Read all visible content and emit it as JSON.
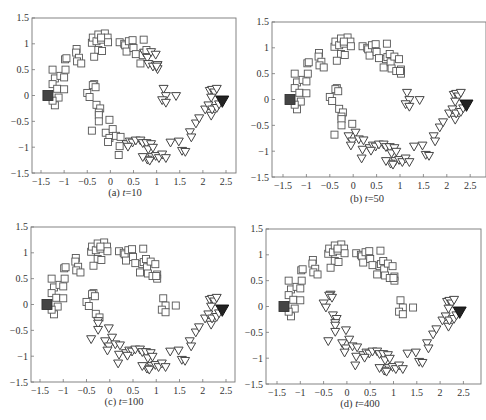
{
  "figure": {
    "panels": [
      {
        "id": "a",
        "caption_prefix": "(a) ",
        "caption_var": "t",
        "caption_value": "=10"
      },
      {
        "id": "b",
        "caption_prefix": "(b) ",
        "caption_var": "t",
        "caption_value": "=50"
      },
      {
        "id": "c",
        "caption_prefix": "(c) ",
        "caption_var": "t",
        "caption_value": "=100"
      },
      {
        "id": "d",
        "caption_prefix": "(d) ",
        "caption_var": "t",
        "caption_value": "=400"
      }
    ],
    "x_ticks": [
      "-1.5",
      "-1",
      "-0.5",
      "0",
      "0.5",
      "1",
      "1.5",
      "2",
      "2.5"
    ],
    "y_ticks": [
      "1.5",
      "1",
      "0.5",
      "0",
      "-0.5",
      "-1",
      "-1.5"
    ],
    "colors": {
      "square_edge": "#555555",
      "triangle_edge": "#444444",
      "labeled_square": "#444444",
      "labeled_triangle": "#222222",
      "frame": "#777777"
    }
  },
  "chart_data": [
    {
      "type": "scatter",
      "title": "(a) t=10",
      "xlabel": "",
      "ylabel": "",
      "xlim": [
        -1.7,
        2.7
      ],
      "ylim": [
        -1.5,
        1.5
      ],
      "x_ticks": [
        -1.5,
        -1,
        -0.5,
        0,
        0.5,
        1,
        1.5,
        2,
        2.5
      ],
      "y_ticks": [
        -1.5,
        -1,
        -0.5,
        0,
        0.5,
        1,
        1.5
      ],
      "grid": false,
      "legend": "none",
      "series": [
        {
          "name": "class 1 (squares)",
          "marker": "square-open",
          "note": "upper moon plus inner part of lower moon"
        },
        {
          "name": "class 2 (triangles)",
          "marker": "triangle-down-open",
          "note": "outer parts of both moons near class-2 seed"
        },
        {
          "name": "labeled class 1",
          "marker": "square-filled",
          "x": [
            -1.35
          ],
          "y": [
            0.0
          ]
        },
        {
          "name": "labeled class 2",
          "marker": "triangle-down-filled",
          "x": [
            2.42
          ],
          "y": [
            -0.12
          ]
        }
      ]
    },
    {
      "type": "scatter",
      "title": "(b) t=50",
      "xlim": [
        -1.7,
        2.7
      ],
      "ylim": [
        -1.5,
        1.5
      ],
      "grid": false,
      "legend": "none",
      "series": [
        {
          "name": "class 1 (squares)",
          "marker": "square-open",
          "note": "upper moon and left half of lower moon"
        },
        {
          "name": "class 2 (triangles)",
          "marker": "triangle-down-open",
          "note": "lower moon from x~-0.1 to right"
        },
        {
          "name": "labeled class 1",
          "marker": "square-filled",
          "x": [
            -1.35
          ],
          "y": [
            0.0
          ]
        },
        {
          "name": "labeled class 2",
          "marker": "triangle-down-filled",
          "x": [
            2.42
          ],
          "y": [
            -0.12
          ]
        }
      ]
    },
    {
      "type": "scatter",
      "title": "(c) t=100",
      "xlim": [
        -1.7,
        2.7
      ],
      "ylim": [
        -1.5,
        1.5
      ],
      "grid": false,
      "legend": "none",
      "series": [
        {
          "name": "class 1 (squares)",
          "marker": "square-open",
          "note": "upper moon, tips of lower moon near x~-0.35..-0.2 and cluster near x~1.2, y~0"
        },
        {
          "name": "class 2 (triangles)",
          "marker": "triangle-down-open",
          "note": "most of lower moon"
        },
        {
          "name": "labeled class 1",
          "marker": "square-filled",
          "x": [
            -1.35
          ],
          "y": [
            0.0
          ]
        },
        {
          "name": "labeled class 2",
          "marker": "triangle-down-filled",
          "x": [
            2.42
          ],
          "y": [
            -0.12
          ]
        }
      ]
    },
    {
      "type": "scatter",
      "title": "(d) t=400",
      "xlim": [
        -1.7,
        2.7
      ],
      "ylim": [
        -1.5,
        1.5
      ],
      "grid": false,
      "legend": "none",
      "series": [
        {
          "name": "class 1 (squares)",
          "marker": "square-open",
          "note": "entire upper moon plus cluster near x~1.2, y~0"
        },
        {
          "name": "class 2 (triangles)",
          "marker": "triangle-down-open",
          "note": "entire lower moon"
        },
        {
          "name": "labeled class 1",
          "marker": "square-filled",
          "x": [
            -1.35
          ],
          "y": [
            0.0
          ]
        },
        {
          "name": "labeled class 2",
          "marker": "triangle-down-filled",
          "x": [
            2.42
          ],
          "y": [
            -0.12
          ]
        }
      ]
    }
  ],
  "points": {
    "upper": [
      [
        -1.25,
        0.5
      ],
      [
        -1.2,
        0.33
      ],
      [
        -1.25,
        0.22
      ],
      [
        -1.15,
        0.13
      ],
      [
        -1.08,
        0.38
      ],
      [
        -1.0,
        0.35
      ],
      [
        -0.97,
        0.5
      ],
      [
        -0.98,
        0.7
      ],
      [
        -0.95,
        0.72
      ],
      [
        -1.0,
        0.12
      ],
      [
        -1.12,
        -0.04
      ],
      [
        -1.2,
        -0.19
      ],
      [
        -1.25,
        -0.1
      ],
      [
        -0.73,
        0.9
      ],
      [
        -0.74,
        0.83
      ],
      [
        -0.68,
        0.73
      ],
      [
        -0.72,
        0.66
      ],
      [
        -0.63,
        0.62
      ],
      [
        -0.4,
        1.02
      ],
      [
        -0.38,
        1.12
      ],
      [
        -0.3,
        1.05
      ],
      [
        -0.26,
        1.18
      ],
      [
        -0.2,
        1.08
      ],
      [
        -0.12,
        1.2
      ],
      [
        -0.06,
        1.12
      ],
      [
        -0.05,
        1.03
      ],
      [
        -0.26,
        0.88
      ],
      [
        -0.18,
        0.86
      ],
      [
        -0.35,
        0.75
      ],
      [
        -0.2,
        1.12
      ],
      [
        0.2,
        1.03
      ],
      [
        0.3,
        1.0
      ],
      [
        0.32,
        0.97
      ],
      [
        0.4,
        1.05
      ],
      [
        0.48,
        1.07
      ],
      [
        0.35,
        0.85
      ],
      [
        0.5,
        0.92
      ],
      [
        0.55,
        0.8
      ],
      [
        0.65,
        0.62
      ],
      [
        0.7,
        0.78
      ],
      [
        0.73,
        0.82
      ],
      [
        0.78,
        0.88
      ],
      [
        0.72,
        1.08
      ],
      [
        0.8,
        0.72
      ],
      [
        0.88,
        0.83
      ],
      [
        0.82,
        0.6
      ],
      [
        0.92,
        0.55
      ],
      [
        0.98,
        0.78
      ],
      [
        1.02,
        0.58
      ],
      [
        1.02,
        0.5
      ],
      [
        1.0,
        0.55
      ]
    ],
    "lower_inner": [
      [
        -0.35,
        0.22
      ],
      [
        -0.38,
        0.2
      ],
      [
        -0.32,
        0.16
      ],
      [
        -0.5,
        0.05
      ],
      [
        -0.45,
        -0.03
      ],
      [
        -0.3,
        -0.18
      ],
      [
        -0.22,
        -0.25
      ],
      [
        -0.25,
        -0.33
      ],
      [
        -0.25,
        -0.38
      ],
      [
        -0.25,
        -0.5
      ],
      [
        -0.02,
        -0.47
      ],
      [
        -0.4,
        -0.68
      ],
      [
        -0.1,
        -0.72
      ],
      [
        0.05,
        -0.65
      ],
      [
        -0.02,
        -0.82
      ],
      [
        -0.05,
        -0.9
      ],
      [
        0.12,
        -0.78
      ],
      [
        0.22,
        -0.8
      ],
      [
        0.2,
        -0.98
      ],
      [
        0.18,
        -1.15
      ]
    ],
    "mid_cluster": [
      [
        1.15,
        0.12
      ],
      [
        1.2,
        -0.02
      ],
      [
        1.12,
        -0.1
      ],
      [
        1.2,
        -0.15
      ],
      [
        1.42,
        -0.02
      ]
    ],
    "lower_outer": [
      [
        0.35,
        -0.95
      ],
      [
        0.42,
        -0.9
      ],
      [
        0.48,
        -0.92
      ],
      [
        0.38,
        -1.0
      ],
      [
        0.55,
        -0.88
      ],
      [
        0.65,
        -0.88
      ],
      [
        0.7,
        -0.93
      ],
      [
        0.78,
        -0.93
      ],
      [
        0.82,
        -1.05
      ],
      [
        0.88,
        -0.95
      ],
      [
        0.92,
        -1.02
      ],
      [
        0.9,
        -1.2
      ],
      [
        0.8,
        -1.25
      ],
      [
        0.98,
        -1.18
      ],
      [
        1.05,
        -1.22
      ],
      [
        1.12,
        -1.15
      ],
      [
        1.2,
        -1.22
      ],
      [
        1.3,
        -0.92
      ],
      [
        1.48,
        -0.9
      ],
      [
        1.55,
        -1.08
      ],
      [
        1.62,
        -1.1
      ],
      [
        1.72,
        -0.72
      ],
      [
        1.75,
        -0.82
      ],
      [
        1.85,
        -0.55
      ],
      [
        1.92,
        -0.45
      ],
      [
        2.05,
        -0.28
      ],
      [
        2.12,
        -0.2
      ],
      [
        2.18,
        -0.4
      ],
      [
        2.2,
        -0.28
      ],
      [
        2.3,
        -0.25
      ],
      [
        2.15,
        0.08
      ],
      [
        2.2,
        0.1
      ],
      [
        2.25,
        0.05
      ],
      [
        2.3,
        0.12
      ],
      [
        2.18,
        -0.05
      ],
      [
        2.35,
        -0.18
      ],
      [
        0.85,
        -1.27
      ],
      [
        0.7,
        -1.2
      ]
    ]
  }
}
